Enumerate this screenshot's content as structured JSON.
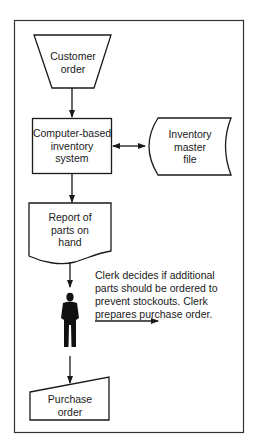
{
  "diagram": {
    "type": "system-flowchart",
    "nodes": {
      "customer_order": {
        "shape": "manual-operation-trapezoid",
        "line1": "Customer",
        "line2": "order"
      },
      "inventory_system": {
        "shape": "process-rectangle",
        "line1": "Computer-based",
        "line2": "inventory",
        "line3": "system"
      },
      "master_file": {
        "shape": "stored-data",
        "line1": "Inventory",
        "line2": "master",
        "line3": "file"
      },
      "report": {
        "shape": "document",
        "line1": "Report of",
        "line2": "parts on",
        "line3": "hand"
      },
      "clerk": {
        "shape": "person-icon"
      },
      "purchase_order": {
        "shape": "manual-input",
        "line1": "Purchase",
        "line2": "order"
      }
    },
    "note": {
      "line1": "Clerk decides if additional",
      "line2": "parts should be ordered to",
      "line3": "prevent stockouts. Clerk",
      "line4": "prepares purchase order."
    },
    "edges": [
      {
        "from": "customer_order",
        "to": "inventory_system",
        "arrow": "single"
      },
      {
        "from": "inventory_system",
        "to": "master_file",
        "arrow": "double"
      },
      {
        "from": "inventory_system",
        "to": "report",
        "arrow": "single"
      },
      {
        "from": "report",
        "to": "clerk",
        "arrow": "single"
      },
      {
        "from": "clerk",
        "to": "purchase_order",
        "arrow": "single"
      },
      {
        "from": "note",
        "to": "offpage-right",
        "arrow": "single"
      }
    ],
    "colors": {
      "stroke": "#1a1a1a",
      "background": "#ffffff"
    }
  }
}
